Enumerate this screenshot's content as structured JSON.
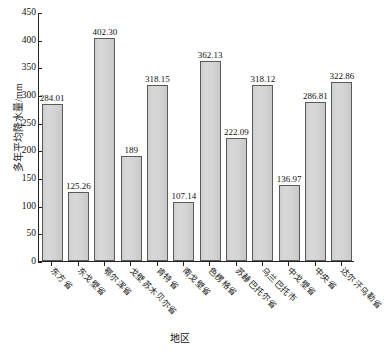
{
  "chart_data": {
    "type": "bar",
    "title": "",
    "xlabel": "地区",
    "ylabel": "多年平均降水量/mm",
    "ylim": [
      0,
      450
    ],
    "yticks": [
      0,
      50,
      100,
      150,
      200,
      250,
      300,
      350,
      400,
      450
    ],
    "grid": false,
    "legend": null,
    "bar_color": "#d4d4d4",
    "bar_edge_color": "#5a5a5a",
    "categories": [
      "东方省",
      "东戈壁省",
      "鄂尔浑省",
      "戈壁苏木贝尔省",
      "肯特省",
      "南戈壁省",
      "色楞格省",
      "苏赫巴托尔省",
      "乌兰巴托市",
      "中戈壁省",
      "中央省",
      "达尔汗乌勒省"
    ],
    "values": [
      284.01,
      125.26,
      402.3,
      189,
      318.15,
      107.14,
      362.13,
      222.09,
      318.12,
      136.97,
      286.81,
      322.86
    ],
    "value_labels": [
      "284.01",
      "125.26",
      "402.30",
      "189",
      "318.15",
      "107.14",
      "362.13",
      "222.09",
      "318.12",
      "136.97",
      "286.81",
      "322.86"
    ]
  }
}
